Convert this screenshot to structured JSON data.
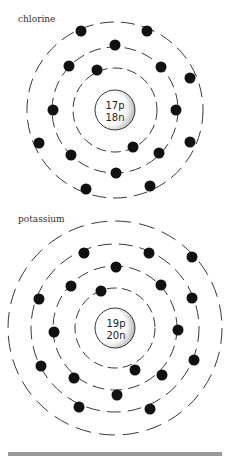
{
  "atoms": [
    {
      "name": "chlorine",
      "nucleus": {
        "protons": "17p",
        "neutrons": "18n"
      },
      "center": [
        115,
        110
      ],
      "nucleus_radius": 20,
      "shells": [
        42,
        63,
        88
      ],
      "electrons_per_shell": [
        2,
        8,
        7
      ],
      "electrons": [
        [
          81,
          31
        ],
        [
          147,
          31
        ],
        [
          115,
          45
        ],
        [
          69,
          66
        ],
        [
          161,
          67
        ],
        [
          97,
          70
        ],
        [
          190,
          78
        ],
        [
          53,
          110
        ],
        [
          176,
          110
        ],
        [
          39,
          143
        ],
        [
          190,
          142
        ],
        [
          133,
          147
        ],
        [
          71,
          155
        ],
        [
          159,
          153
        ],
        [
          116,
          173
        ],
        [
          86,
          189
        ],
        [
          150,
          186
        ]
      ]
    },
    {
      "name": "potassium",
      "nucleus": {
        "protons": "19p",
        "neutrons": "20n"
      },
      "center": [
        115,
        328
      ],
      "nucleus_radius": 20,
      "shells": [
        40,
        62,
        84,
        107
      ],
      "electrons_per_shell": [
        2,
        8,
        8,
        1
      ],
      "electrons": [
        [
          84,
          253
        ],
        [
          149,
          253
        ],
        [
          192,
          257
        ],
        [
          116,
          267
        ],
        [
          71,
          286
        ],
        [
          161,
          285
        ],
        [
          101,
          291
        ],
        [
          39,
          299
        ],
        [
          192,
          298
        ],
        [
          54,
          332
        ],
        [
          178,
          330
        ],
        [
          41,
          366
        ],
        [
          194,
          360
        ],
        [
          135,
          370
        ],
        [
          74,
          378
        ],
        [
          162,
          375
        ],
        [
          117,
          395
        ],
        [
          79,
          407
        ],
        [
          150,
          409
        ]
      ]
    }
  ],
  "caption_partial": "Fig. ... the structure of chlorine and potassium"
}
